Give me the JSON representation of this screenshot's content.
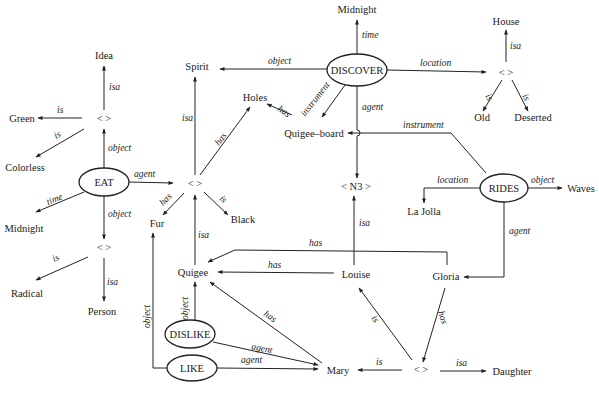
{
  "diagram": {
    "type": "semantic-network",
    "events": {
      "eat": "EAT",
      "discover": "DISCOVER",
      "rides": "RIDES",
      "dislike": "DISLIKE",
      "like": "LIKE"
    },
    "concepts": {
      "idea": "Idea",
      "green": "Green",
      "colorless": "Colorless",
      "midnight1": "Midnight",
      "radical": "Radical",
      "person": "Person",
      "spirit": "Spirit",
      "holes": "Holes",
      "fur": "Fur",
      "black": "Black",
      "quigee": "Quigee",
      "quigee_board": "Quigee–board",
      "midnight2": "Midnight",
      "house": "House",
      "old": "Old",
      "deserted": "Deserted",
      "n3": "< N3 >",
      "la_jolla": "La Jolla",
      "waves": "Waves",
      "louise": "Louise",
      "gloria": "Gloria",
      "mary": "Mary",
      "daughter": "Daughter",
      "anon": "<   >"
    },
    "relations": {
      "isa": "isa",
      "is": "is",
      "object": "object",
      "agent": "agent",
      "time": "time",
      "has": "has",
      "location": "location",
      "instrument": "instrument"
    }
  }
}
